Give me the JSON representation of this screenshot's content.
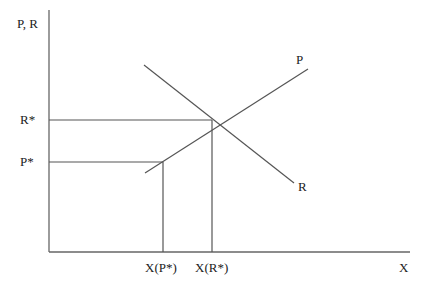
{
  "diagram": {
    "y_axis_label": "P, R",
    "x_axis_label": "X",
    "curves": [
      {
        "name": "P",
        "label": "P",
        "direction": "upward-sloping"
      },
      {
        "name": "R",
        "label": "R",
        "direction": "downward-sloping"
      }
    ],
    "y_ticks": [
      {
        "label": "R*"
      },
      {
        "label": "P*"
      }
    ],
    "x_ticks": [
      {
        "label": "X(P*)"
      },
      {
        "label": "X(R*)"
      }
    ]
  }
}
